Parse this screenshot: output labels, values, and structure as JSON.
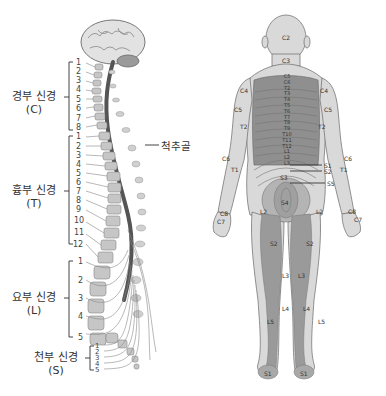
{
  "spine_diagram": {
    "callout": "척추골",
    "groups": [
      {
        "name": "경부 신경",
        "abbr": "(C)",
        "count": 8,
        "numbers": [
          "1",
          "2",
          "3",
          "4",
          "5",
          "6",
          "7",
          "8"
        ]
      },
      {
        "name": "흉부 신경",
        "abbr": "(T)",
        "count": 12,
        "numbers": [
          "1",
          "2",
          "3",
          "4",
          "5",
          "6",
          "7",
          "8",
          "9",
          "10",
          "11",
          "12"
        ]
      },
      {
        "name": "요부 신경",
        "abbr": "(L)",
        "count": 5,
        "numbers": [
          "1",
          "2",
          "3",
          "4",
          "5"
        ]
      },
      {
        "name": "천부 신경",
        "abbr": "(S)",
        "count": 5,
        "numbers": [
          "1",
          "2",
          "3",
          "4",
          "5"
        ]
      }
    ]
  },
  "dermatome_map": {
    "view": "posterior",
    "labels": {
      "head": "C2",
      "neck": "C3",
      "shoulder_left": "C4",
      "shoulder_right": "C4",
      "upper_arm_left": "C5",
      "upper_arm_right": "C5",
      "inner_arm_left": "T2",
      "inner_arm_right": "T2",
      "forearm_left": "C6",
      "forearm_right": "C6",
      "forearm_inner_left": "T1",
      "forearm_inner_right": "T1",
      "hand_left": "C8",
      "hand_right": "C8",
      "finger_left": "C7",
      "finger_right": "C7",
      "spine_levels": [
        "C5",
        "C6",
        "T2",
        "T3",
        "T4",
        "T5",
        "T6",
        "T7",
        "T8",
        "T9",
        "T10",
        "T11",
        "T12",
        "L1",
        "L2",
        "L3"
      ],
      "sacral_callouts": [
        "S1",
        "S2",
        "S5"
      ],
      "buttock": "S3",
      "perianal": "S4",
      "hip_left": "L2",
      "hip_right": "L2",
      "thigh_left": "S2",
      "thigh_right": "S2",
      "knee_left": "L3",
      "knee_right": "L3",
      "calf_left": "L4",
      "calf_right": "L4",
      "lateral_calf_left": "L5",
      "lateral_calf_right": "L5",
      "heel_left": "S1",
      "heel_right": "S1"
    },
    "colors": {
      "dark": "#8f8f8f",
      "mid": "#b4b4b4",
      "light": "#d9d9d9",
      "outline": "#777777"
    }
  }
}
